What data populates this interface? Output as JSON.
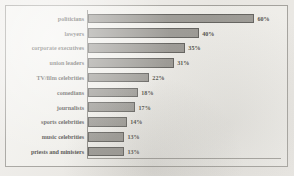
{
  "chart_data": {
    "type": "bar",
    "orientation": "horizontal",
    "title": "",
    "subtitle": "",
    "xlabel": "",
    "ylabel": "",
    "xlim": [
      0,
      60
    ],
    "grid": false,
    "legend": null,
    "value_suffix": "%",
    "categories": [
      "politicians",
      "lawyers",
      "corporate executives",
      "union leaders",
      "TV/film celebrities",
      "comedians",
      "journalists",
      "sports celebrities",
      "music celebrities",
      "priests and ministers"
    ],
    "values": [
      60,
      40,
      35,
      31,
      22,
      18,
      17,
      14,
      13,
      13
    ],
    "value_labels": [
      "60%",
      "40%",
      "35%",
      "31%",
      "22%",
      "18%",
      "17%",
      "14%",
      "13%",
      "13%"
    ],
    "bar_color": "#85837e",
    "bar_edge_color": "#393835",
    "background_color": "#f2f1ed",
    "text_color": "#1b1a18",
    "axis_color": "#6f6d68"
  }
}
